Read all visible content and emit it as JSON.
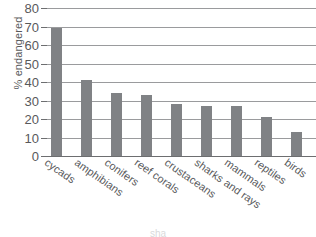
{
  "chart_data": {
    "type": "bar",
    "title": "",
    "xlabel": "",
    "ylabel": "% endangered",
    "ylim": [
      0,
      80
    ],
    "yticks": [
      0,
      10,
      20,
      30,
      40,
      50,
      60,
      70,
      80
    ],
    "grid": true,
    "legend": null,
    "categories": [
      "cycads",
      "amphibians",
      "conifers",
      "reef corals",
      "crustaceans",
      "sharks and rays",
      "mammals",
      "reptiles",
      "birds"
    ],
    "values": [
      69,
      41,
      34,
      33,
      28,
      27,
      27,
      21,
      13
    ],
    "bar_color": "#808285",
    "gridline_color": "#9a9b9d",
    "text_color": "#58595b"
  },
  "margin_note": {
    "line1": "n",
    "line2": "st"
  },
  "bottom_note": {
    "text": "sha"
  }
}
